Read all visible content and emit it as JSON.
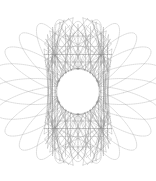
{
  "canvas": {
    "width": 156,
    "height": 181,
    "background_color": "#ffffff",
    "title": "spirograph-figure"
  },
  "figure": {
    "name": "spirograph-rose-envelope",
    "center_x": 78,
    "center_y": 91.5,
    "bounds": {
      "left": 22,
      "top": 18,
      "right": 133,
      "bottom": 166
    },
    "radius_x": 55,
    "radius_y": 74,
    "inner_hole_radius_x": 22,
    "inner_hole_radius_y": 23,
    "stroke_color": "#8a8a8a",
    "stroke_color_dense": "#4a4a4a",
    "stroke_color_light": "#c0c0c0",
    "stroke_width": 0.38,
    "dash_pattern": "0.9 1.0",
    "opacity": 0.85
  },
  "chart_data": {
    "type": "line",
    "title": "",
    "xlabel": "",
    "ylabel": "",
    "curve_family": "epitrochoid-chord-envelope",
    "point_count": 72,
    "chord_step": 29,
    "petal_count": 24,
    "loops": 12,
    "harmonic_ratio_x": 1,
    "harmonic_ratio_y": 2,
    "phase_offset_deg": 0,
    "amplitude_x": 55,
    "amplitude_y": 74,
    "xlim": [
      22,
      133
    ],
    "ylim": [
      18,
      166
    ],
    "grid": false,
    "legend": null,
    "series": [
      {
        "name": "outer-envelope-chords",
        "kind": "chords",
        "node_count": 72,
        "step": 29,
        "radius_x": 55,
        "radius_y": 74,
        "stroke": "#8a8a8a"
      },
      {
        "name": "mid-envelope-chords",
        "kind": "chords",
        "node_count": 72,
        "step": 23,
        "radius_x": 50,
        "radius_y": 67,
        "stroke": "#9a9a9a"
      },
      {
        "name": "inner-envelope-chords",
        "kind": "chords",
        "node_count": 72,
        "step": 17,
        "radius_x": 44,
        "radius_y": 59,
        "stroke": "#a8a8a8"
      },
      {
        "name": "petal-loops",
        "kind": "loops",
        "loop_count": 24,
        "outer_radius_x": 55,
        "outer_radius_y": 74,
        "inner_radius": 23,
        "stroke": "#8f8f8f"
      },
      {
        "name": "center-lens-rim",
        "kind": "ring",
        "radius_x": 22,
        "radius_y": 23,
        "stroke": "#5a5a5a"
      }
    ]
  }
}
